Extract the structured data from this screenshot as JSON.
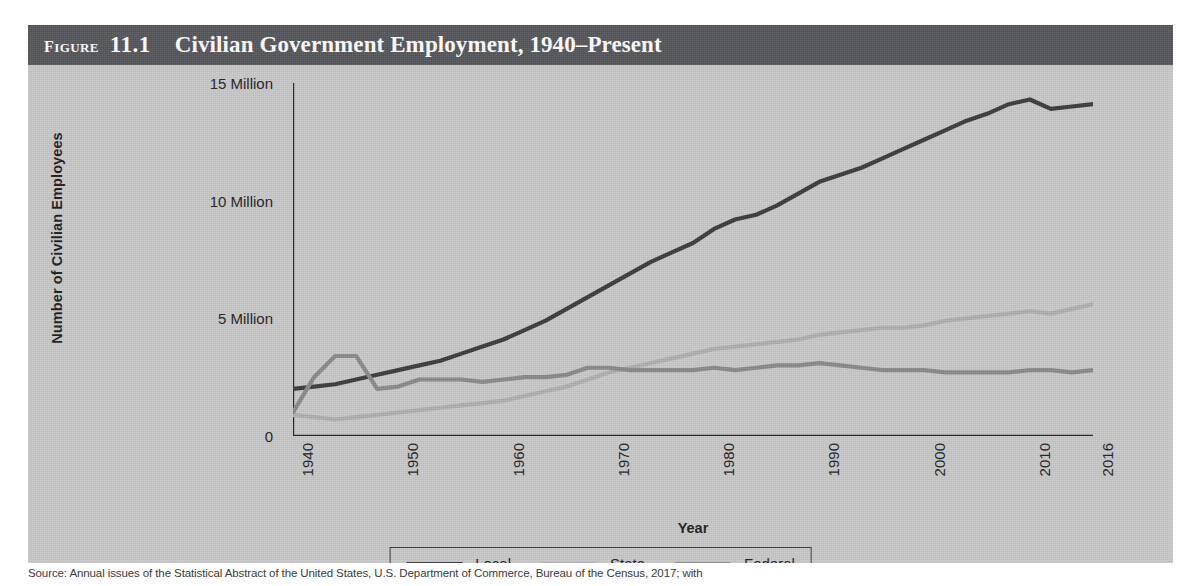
{
  "figure": {
    "label_word": "Figure",
    "number": "11.1",
    "title": "Civilian Government Employment, 1940–Present"
  },
  "source_note": "Source: Annual issues of the Statistical Abstract of the United States, U.S. Department of Commerce, Bureau of the Census, 2017; with",
  "colors": {
    "title_bar": "#55565a",
    "panel_background": "#c9c9c9",
    "axis": "#262626",
    "local": "#3b3b3b",
    "state": "#b0b0b0",
    "federal": "#8a8a8a"
  },
  "chart_data": {
    "type": "line",
    "title": "Civilian Government Employment, 1940–Present",
    "xlabel": "Year",
    "ylabel": "Number of Civilian Employees",
    "xlim": [
      1940,
      2016
    ],
    "ylim": [
      0,
      15
    ],
    "y_unit": "millions",
    "grid": false,
    "legend_position": "bottom",
    "x_tick_labels": [
      "1940",
      "1950",
      "1960",
      "1970",
      "1980",
      "1990",
      "2000",
      "2010",
      "2016"
    ],
    "x_tick_values": [
      1940,
      1950,
      1960,
      1970,
      1980,
      1990,
      2000,
      2010,
      2016
    ],
    "y_tick_labels": [
      "0",
      "5 Million",
      "10 Million",
      "15 Million"
    ],
    "y_tick_values": [
      0,
      5,
      10,
      15
    ],
    "y_minor_tick_step": 1,
    "x_minor_tick_step": 2,
    "x": [
      1940,
      1942,
      1944,
      1946,
      1948,
      1950,
      1952,
      1954,
      1956,
      1958,
      1960,
      1962,
      1964,
      1966,
      1968,
      1970,
      1972,
      1974,
      1976,
      1978,
      1980,
      1982,
      1984,
      1986,
      1988,
      1990,
      1992,
      1994,
      1996,
      1998,
      2000,
      2002,
      2004,
      2006,
      2008,
      2010,
      2012,
      2014,
      2016
    ],
    "series": [
      {
        "name": "Local",
        "color": "#3b3b3b",
        "values": [
          2.0,
          2.1,
          2.2,
          2.4,
          2.6,
          2.8,
          3.0,
          3.2,
          3.5,
          3.8,
          4.1,
          4.5,
          4.9,
          5.4,
          5.9,
          6.4,
          6.9,
          7.4,
          7.8,
          8.2,
          8.8,
          9.2,
          9.4,
          9.8,
          10.3,
          10.8,
          11.1,
          11.4,
          11.8,
          12.2,
          12.6,
          13.0,
          13.4,
          13.7,
          14.1,
          14.3,
          13.9,
          14.0,
          14.1
        ]
      },
      {
        "name": "State",
        "color": "#b0b0b0",
        "values": [
          0.9,
          0.8,
          0.7,
          0.8,
          0.9,
          1.0,
          1.1,
          1.2,
          1.3,
          1.4,
          1.5,
          1.7,
          1.9,
          2.1,
          2.4,
          2.7,
          2.9,
          3.1,
          3.3,
          3.5,
          3.7,
          3.8,
          3.9,
          4.0,
          4.1,
          4.3,
          4.4,
          4.5,
          4.6,
          4.6,
          4.7,
          4.9,
          5.0,
          5.1,
          5.2,
          5.3,
          5.2,
          5.4,
          5.6
        ]
      },
      {
        "name": "Federal",
        "color": "#8a8a8a",
        "values": [
          1.0,
          2.5,
          3.4,
          3.4,
          2.0,
          2.1,
          2.4,
          2.4,
          2.4,
          2.3,
          2.4,
          2.5,
          2.5,
          2.6,
          2.9,
          2.9,
          2.8,
          2.8,
          2.8,
          2.8,
          2.9,
          2.8,
          2.9,
          3.0,
          3.0,
          3.1,
          3.0,
          2.9,
          2.8,
          2.8,
          2.8,
          2.7,
          2.7,
          2.7,
          2.7,
          2.8,
          2.8,
          2.7,
          2.8
        ]
      }
    ]
  },
  "legend": {
    "items": [
      {
        "label": "Local"
      },
      {
        "label": "State"
      },
      {
        "label": "Federal"
      }
    ]
  }
}
